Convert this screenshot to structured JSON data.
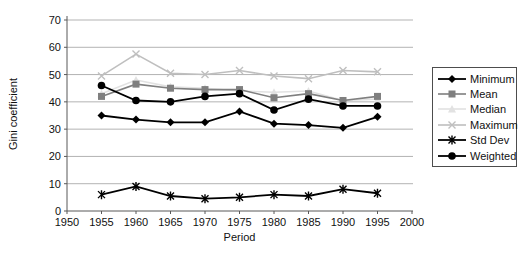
{
  "chart_data": {
    "type": "line",
    "title": "",
    "xlabel": "Period",
    "ylabel": "Gini coefficient",
    "xlim": [
      1950,
      2000
    ],
    "ylim": [
      0,
      70
    ],
    "xticks": [
      1950,
      1955,
      1960,
      1965,
      1970,
      1975,
      1980,
      1985,
      1990,
      1995,
      2000
    ],
    "yticks": [
      0,
      10,
      20,
      30,
      40,
      50,
      60,
      70
    ],
    "grid": "horizontal",
    "legend_position": "right",
    "x": [
      1955,
      1960,
      1965,
      1970,
      1975,
      1980,
      1985,
      1990,
      1995
    ],
    "series": [
      {
        "name": "Minimum",
        "marker": "diamond",
        "color": "#000000",
        "values": [
          35,
          33.5,
          32.5,
          32.5,
          36.5,
          32,
          31.5,
          30.5,
          34.5
        ]
      },
      {
        "name": "Mean",
        "marker": "square",
        "color": "#7f7f7f",
        "values": [
          42,
          46.5,
          45,
          44.5,
          44.5,
          41.5,
          43,
          40.5,
          42
        ]
      },
      {
        "name": "Median",
        "marker": "triangle",
        "color": "#e2e2e2",
        "values": [
          43,
          48,
          45.5,
          45,
          44,
          43.5,
          44,
          40.5,
          41
        ]
      },
      {
        "name": "Maximum",
        "marker": "x",
        "color": "#bfbfbf",
        "values": [
          49.5,
          57.5,
          50.5,
          50,
          51.5,
          49.5,
          48.5,
          51.5,
          51
        ]
      },
      {
        "name": "Std Dev",
        "marker": "star",
        "color": "#000000",
        "values": [
          6,
          9,
          5.5,
          4.5,
          5,
          6,
          5.5,
          8,
          6.5
        ]
      },
      {
        "name": "Weighted",
        "marker": "circle",
        "color": "#000000",
        "values": [
          46,
          40.5,
          40,
          42,
          43,
          37,
          41,
          38.5,
          38.5
        ]
      }
    ]
  },
  "style_colors": {
    "grid": "#b3b3b3",
    "axis": "#595959",
    "tick_text": "#111111"
  }
}
